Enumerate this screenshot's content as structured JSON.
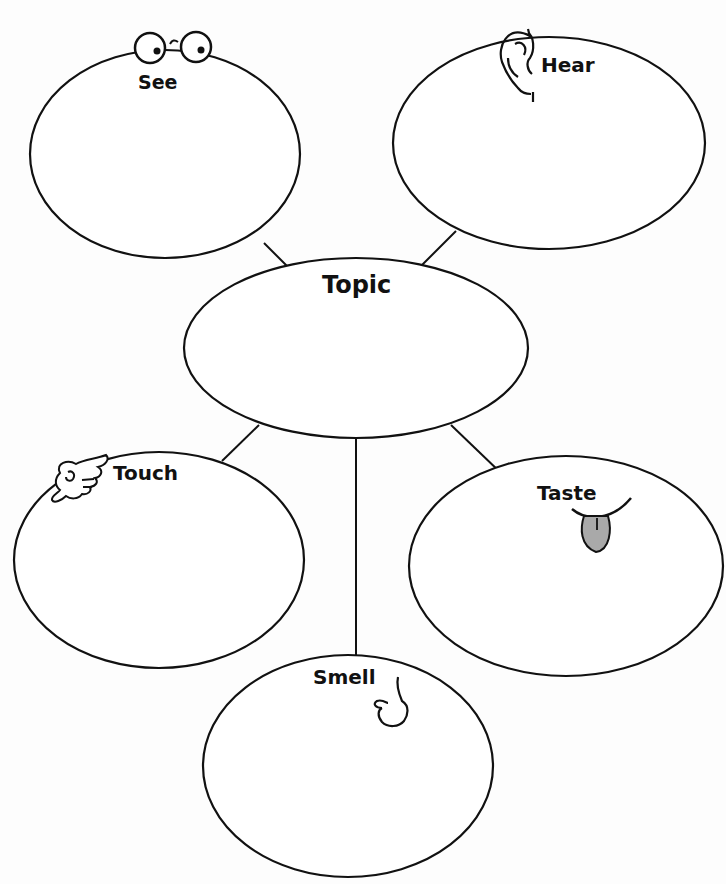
{
  "diagram": {
    "type": "five-senses-graphic-organizer",
    "center": {
      "label": "Topic"
    },
    "nodes": [
      {
        "id": "see",
        "label": "Senses: See",
        "text": "See",
        "icon": "eyes-icon"
      },
      {
        "id": "hear",
        "label": "Senses: Hear",
        "text": "Hear",
        "icon": "ear-icon"
      },
      {
        "id": "touch",
        "label": "Senses: Touch",
        "text": "Touch",
        "icon": "pointing-hand-icon"
      },
      {
        "id": "taste",
        "label": "Senses: Taste",
        "text": "Taste",
        "icon": "tongue-icon"
      },
      {
        "id": "smell",
        "label": "Senses: Smell",
        "text": "Smell",
        "icon": "nose-icon"
      }
    ],
    "colors": {
      "stroke": "#111111",
      "background": "#fdfdfd",
      "tongue_fill": "#a9a9a9"
    }
  }
}
